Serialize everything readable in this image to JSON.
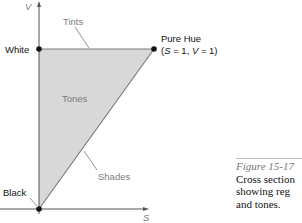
{
  "axes": {
    "y_label": "V",
    "x_label": "S"
  },
  "points": {
    "white": "White",
    "black": "Black",
    "pure_hue_line1": "Pure Hue",
    "pure_hue_line2_parts": [
      "(",
      "S",
      " = 1, ",
      "V",
      " = 1)"
    ]
  },
  "regions": {
    "tints": "Tints",
    "tones": "Tones",
    "shades": "Shades"
  },
  "caption": {
    "title": "Figure 15-17",
    "line1": "Cross section",
    "line2": "showing reg",
    "line3": "and tones."
  },
  "colors": {
    "fill": "#d6d6d6",
    "edge": "#7d7d7d",
    "axis": "#555555",
    "dot": "#111111"
  }
}
